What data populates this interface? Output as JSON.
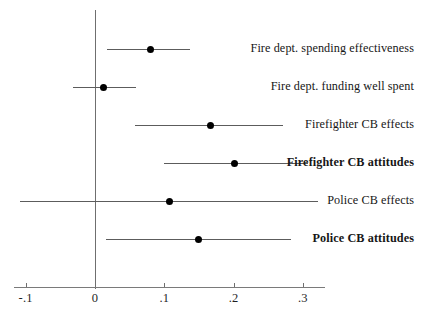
{
  "chart_data": {
    "type": "scatter",
    "title": "",
    "subtitle": "",
    "xlabel": "",
    "ylabel": "",
    "xlim": [
      -0.137,
      0.47
    ],
    "xticks": [
      -0.1,
      0,
      0.1,
      0.2,
      0.3
    ],
    "xtick_labels": [
      "-.1",
      "0",
      ".1",
      ".2",
      ".3"
    ],
    "grid": false,
    "legend": "none",
    "reference_line": 0,
    "orientation": "horizontal",
    "note": "Coefficient plot with point estimates and confidence interval whiskers; categories listed top to bottom.",
    "categories": [
      "Fire dept. spending effectiveness",
      "Fire dept. funding well spent",
      "Firefighter CB effects",
      "Firefighter CB attitudes",
      "Police CB effects",
      "Police CB attitudes"
    ],
    "values": [
      0.08,
      0.012,
      0.166,
      0.202,
      0.108,
      0.149
    ],
    "ci_low": [
      0.017,
      -0.032,
      0.058,
      0.1,
      -0.108,
      0.016
    ],
    "ci_high": [
      0.137,
      0.059,
      0.271,
      0.307,
      0.322,
      0.283
    ],
    "emphasis": [
      false,
      false,
      false,
      true,
      false,
      true
    ],
    "points": [
      {
        "label": "Fire dept. spending effectiveness",
        "estimate": 0.08,
        "ci_low": 0.017,
        "ci_high": 0.137,
        "bold": false
      },
      {
        "label": "Fire dept. funding well spent",
        "estimate": 0.012,
        "ci_low": -0.032,
        "ci_high": 0.059,
        "bold": false
      },
      {
        "label": "Firefighter CB effects",
        "estimate": 0.166,
        "ci_low": 0.058,
        "ci_high": 0.271,
        "bold": false
      },
      {
        "label": "Firefighter CB attitudes",
        "estimate": 0.202,
        "ci_low": 0.1,
        "ci_high": 0.307,
        "bold": true
      },
      {
        "label": "Police CB effects",
        "estimate": 0.108,
        "ci_low": -0.108,
        "ci_high": 0.322,
        "bold": false
      },
      {
        "label": "Police CB attitudes",
        "estimate": 0.149,
        "ci_low": 0.016,
        "ci_high": 0.283,
        "bold": true
      }
    ],
    "colors": {
      "point": "#000000",
      "whisker": "#5c5c5c",
      "axis": "#7a7a7a",
      "zero_line": "#6f6f6f",
      "background": "#ffffff",
      "text": "#161616"
    }
  }
}
